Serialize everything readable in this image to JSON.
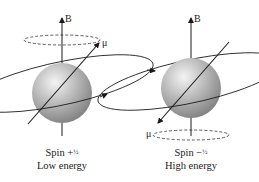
{
  "figure": {
    "panels": [
      {
        "id": "spin-up",
        "field_label": "B",
        "moment_label": "μ",
        "spin_text": "Spin +",
        "spin_fraction": "½",
        "energy_text": "Low energy",
        "moment_direction": "aligned-up"
      },
      {
        "id": "spin-down",
        "field_label": "B",
        "moment_label": "μ",
        "spin_text": "Spin −",
        "spin_fraction": "½",
        "energy_text": "High energy",
        "moment_direction": "opposed-down"
      }
    ],
    "colors": {
      "sphere_light": "#f2f2f2",
      "sphere_mid": "#b8b8b8",
      "sphere_dark": "#7a7a7a",
      "line": "#1a1a1a"
    }
  }
}
